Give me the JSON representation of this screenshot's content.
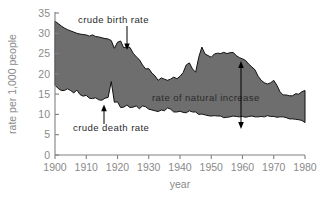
{
  "chart_data": {
    "type": "area",
    "title": "",
    "xlabel": "year",
    "ylabel": "rate per 1,000 people",
    "xlim": [
      1900,
      1980
    ],
    "ylim": [
      0,
      35
    ],
    "grid": false,
    "legend_position": "none",
    "xticks": [
      1900,
      1910,
      1920,
      1930,
      1940,
      1950,
      1960,
      1970,
      1980
    ],
    "yticks": [
      0,
      5,
      10,
      15,
      20,
      25,
      30,
      35
    ],
    "annotations": [
      {
        "text": "crude birth rate",
        "points_to": "upper boundary",
        "year": 1923
      },
      {
        "text": "crude death rate",
        "points_to": "lower boundary",
        "year": 1916
      },
      {
        "text": "rate of natural increase",
        "points_to": "shaded band",
        "year": 1958
      }
    ],
    "series": [
      {
        "name": "crude birth rate",
        "x": [
          1900,
          1901,
          1902,
          1903,
          1904,
          1905,
          1906,
          1907,
          1908,
          1909,
          1910,
          1911,
          1912,
          1913,
          1914,
          1915,
          1916,
          1917,
          1918,
          1919,
          1920,
          1921,
          1922,
          1923,
          1924,
          1925,
          1926,
          1927,
          1928,
          1929,
          1930,
          1931,
          1932,
          1933,
          1934,
          1935,
          1936,
          1937,
          1938,
          1939,
          1940,
          1941,
          1942,
          1943,
          1944,
          1945,
          1946,
          1947,
          1948,
          1949,
          1950,
          1951,
          1952,
          1953,
          1954,
          1955,
          1956,
          1957,
          1958,
          1959,
          1960,
          1961,
          1962,
          1963,
          1964,
          1965,
          1966,
          1967,
          1968,
          1969,
          1970,
          1971,
          1972,
          1973,
          1974,
          1975,
          1976,
          1977,
          1978,
          1979,
          1980
        ],
        "values": [
          33.0,
          32.4,
          31.8,
          31.3,
          30.9,
          30.6,
          30.3,
          30.0,
          29.8,
          29.7,
          29.6,
          29.3,
          29.6,
          29.2,
          29.1,
          28.9,
          28.7,
          28.6,
          28.2,
          26.3,
          27.8,
          28.1,
          26.4,
          26.7,
          26.5,
          25.1,
          24.2,
          23.5,
          22.2,
          21.2,
          21.3,
          20.2,
          19.5,
          18.4,
          19.0,
          18.7,
          18.4,
          18.7,
          19.2,
          18.8,
          19.4,
          20.3,
          22.2,
          22.7,
          21.2,
          20.4,
          24.1,
          26.6,
          24.9,
          24.5,
          24.1,
          24.9,
          25.1,
          25.0,
          25.3,
          25.0,
          25.2,
          25.3,
          24.5,
          24.0,
          23.7,
          23.3,
          22.4,
          21.7,
          21.0,
          19.4,
          18.4,
          17.8,
          17.5,
          17.8,
          18.4,
          17.2,
          15.6,
          14.8,
          14.8,
          14.6,
          14.6,
          15.1,
          15.0,
          15.6,
          15.9
        ]
      },
      {
        "name": "crude death rate",
        "x": [
          1900,
          1901,
          1902,
          1903,
          1904,
          1905,
          1906,
          1907,
          1908,
          1909,
          1910,
          1911,
          1912,
          1913,
          1914,
          1915,
          1916,
          1917,
          1918,
          1919,
          1920,
          1921,
          1922,
          1923,
          1924,
          1925,
          1926,
          1927,
          1928,
          1929,
          1930,
          1931,
          1932,
          1933,
          1934,
          1935,
          1936,
          1937,
          1938,
          1939,
          1940,
          1941,
          1942,
          1943,
          1944,
          1945,
          1946,
          1947,
          1948,
          1949,
          1950,
          1951,
          1952,
          1953,
          1954,
          1955,
          1956,
          1957,
          1958,
          1959,
          1960,
          1961,
          1962,
          1963,
          1964,
          1965,
          1966,
          1967,
          1968,
          1969,
          1970,
          1971,
          1972,
          1973,
          1974,
          1975,
          1976,
          1977,
          1978,
          1979,
          1980
        ],
        "values": [
          17.2,
          16.4,
          15.9,
          15.9,
          16.3,
          15.9,
          15.3,
          16.0,
          14.9,
          14.5,
          14.7,
          14.0,
          13.9,
          14.1,
          13.6,
          13.5,
          14.0,
          14.2,
          18.1,
          13.0,
          13.1,
          11.7,
          11.8,
          12.3,
          11.7,
          11.8,
          12.1,
          11.4,
          12.1,
          11.9,
          11.3,
          11.1,
          10.9,
          10.7,
          11.1,
          10.9,
          11.6,
          11.3,
          10.6,
          10.6,
          10.8,
          10.5,
          10.4,
          10.9,
          10.6,
          10.6,
          10.0,
          10.1,
          9.9,
          9.7,
          9.6,
          9.7,
          9.6,
          9.6,
          9.2,
          9.3,
          9.4,
          9.6,
          9.5,
          9.4,
          9.5,
          9.3,
          9.5,
          9.6,
          9.4,
          9.4,
          9.5,
          9.4,
          9.7,
          9.5,
          9.5,
          9.3,
          9.4,
          9.4,
          9.2,
          8.9,
          8.9,
          8.8,
          8.7,
          8.5,
          8.0
        ]
      }
    ]
  },
  "labels": {
    "birth": "crude birth rate",
    "death": "crude death rate",
    "natural": "rate of natural increase",
    "xlabel": "year",
    "ylabel": "rate per 1,000 people",
    "t1900": "1900",
    "t1910": "1910",
    "t1920": "1920",
    "t1930": "1930",
    "t1940": "1940",
    "t1950": "1950",
    "t1960": "1960",
    "t1970": "1970",
    "t1980": "1980",
    "y0": "0",
    "y5": "5",
    "y10": "10",
    "y15": "15",
    "y20": "20",
    "y25": "25",
    "y30": "30",
    "y35": "35"
  },
  "colors": {
    "band_fill": "#6e6e6e",
    "band_stroke": "#111111",
    "axis": "#808080",
    "tick_text": "#8a8a8a",
    "annotation_text": "#2b2b2b",
    "background": "#ffffff"
  }
}
